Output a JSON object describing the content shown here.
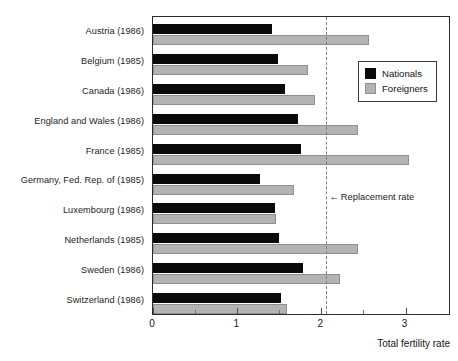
{
  "chart_data": {
    "type": "bar",
    "orientation": "horizontal",
    "title": "",
    "xlabel": "Total fertility rate",
    "ylabel": "",
    "xlim": [
      0,
      3.54
    ],
    "xticks": [
      0,
      1,
      2,
      3
    ],
    "xtick_labels": [
      "0",
      "1",
      "2",
      "3"
    ],
    "xminorticks": [
      0.5,
      1.5,
      2.5
    ],
    "grid": false,
    "legend_position": "upper right",
    "categories": [
      "Austria (1986)",
      "Belgium (1985)",
      "Canada (1986)",
      "England and Wales (1986)",
      "France (1985)",
      "Germany, Fed. Rep. of (1985)",
      "Luxembourg (1986)",
      "Netherlands (1985)",
      "Sweden (1986)",
      "Switzerland (1986)"
    ],
    "series": [
      {
        "name": "Nationals",
        "color": "#0a0a0a",
        "values": [
          1.41,
          1.49,
          1.57,
          1.72,
          1.76,
          1.27,
          1.45,
          1.5,
          1.78,
          1.52
        ]
      },
      {
        "name": "Foreigners",
        "color": "#b3b3b3",
        "values": [
          2.57,
          1.84,
          1.92,
          2.43,
          3.04,
          1.68,
          1.46,
          2.44,
          2.22,
          1.59
        ]
      }
    ],
    "annotations": [
      {
        "name": "replacement-rate",
        "label": "Replacement rate",
        "arrow": "←",
        "x_value": 2.05,
        "style": "dashed vertical line",
        "color": "#7d7d7d"
      }
    ]
  },
  "legend": {
    "entries": [
      {
        "label": "Nationals",
        "swatch": "black-square-icon"
      },
      {
        "label": "Foreigners",
        "swatch": "gray-square-icon"
      }
    ]
  },
  "axis": {
    "x_title": "Total fertility rate"
  }
}
